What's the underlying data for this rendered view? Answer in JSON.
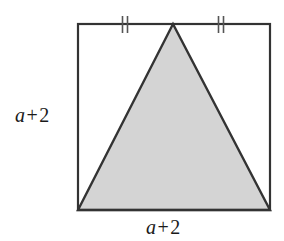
{
  "figure": {
    "type": "geometry-diagram",
    "background_color": "#ffffff",
    "square": {
      "name": "outer-square",
      "stroke_color": "#333333",
      "stroke_width": 2.2,
      "fill": "none",
      "x": 78,
      "y": 24,
      "width": 192,
      "height": 186,
      "side_label": "a + 2"
    },
    "triangle": {
      "name": "shaded-triangle",
      "fill_color": "#d4d4d4",
      "stroke_color": "#333333",
      "stroke_width": 2.4,
      "apex": {
        "x": 173,
        "y": 24
      },
      "base_left": {
        "x": 78,
        "y": 210
      },
      "base_right": {
        "x": 270,
        "y": 210
      }
    },
    "tick_marks": [
      {
        "name": "tick-mark-left",
        "glyph": "double-tick",
        "x": 125,
        "y_top": 16,
        "y_bottom": 33,
        "stroke_color": "#555555",
        "count": 2
      },
      {
        "name": "tick-mark-right",
        "glyph": "double-tick",
        "x": 221,
        "y_top": 16,
        "y_bottom": 33,
        "stroke_color": "#555555",
        "count": 2
      }
    ],
    "labels": {
      "left": {
        "name": "left-side-label",
        "variable": "a",
        "operator": "+",
        "constant": "2",
        "full_text": "a + 2"
      },
      "bottom": {
        "name": "bottom-side-label",
        "variable": "a",
        "operator": "+",
        "constant": "2",
        "full_text": "a + 2"
      }
    }
  }
}
